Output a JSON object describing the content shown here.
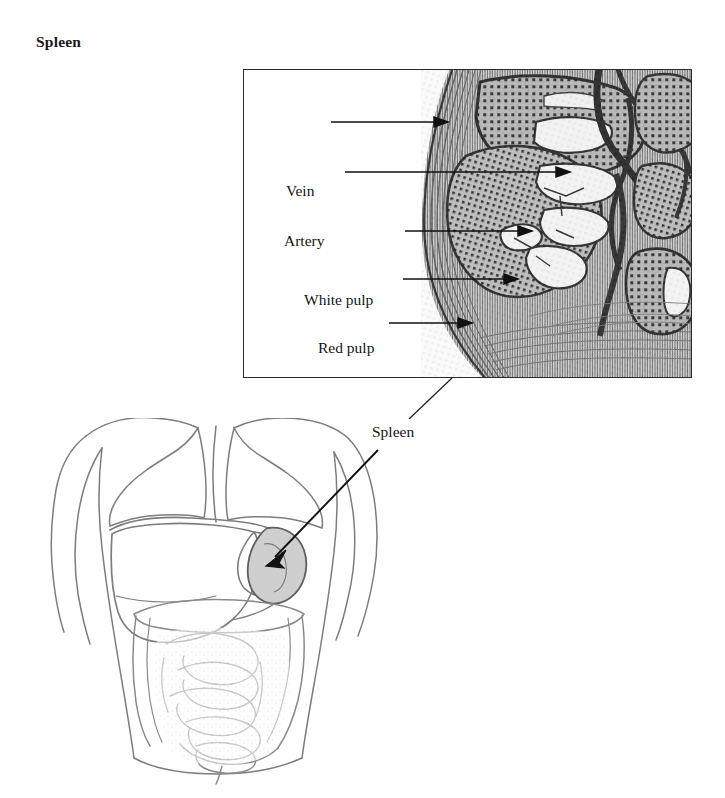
{
  "figure": {
    "title": "Spleen"
  },
  "inset": {
    "name": "spleen-histology-micrograph",
    "labels": [
      {
        "id": "vein",
        "text": "Vein",
        "text_x": 285,
        "text_y": 111,
        "line_x1": 330,
        "line_y1": 121,
        "line_x2": 452,
        "line_y2": 121
      },
      {
        "id": "artery",
        "text": "Artery",
        "text_x": 283,
        "text_y": 159,
        "line_x1": 344,
        "line_y1": 171,
        "line_x2": 572,
        "line_y2": 171
      },
      {
        "id": "white-pulp",
        "text": "White pulp",
        "text_x": 303,
        "text_y": 220,
        "line_x1": 404,
        "line_y1": 230,
        "line_x2": 532,
        "line_y2": 230
      },
      {
        "id": "red-pulp",
        "text": "Red pulp",
        "text_x": 317,
        "text_y": 267,
        "line_x1": 402,
        "line_y1": 278,
        "line_x2": 518,
        "line_y2": 278
      },
      {
        "id": "capsule",
        "text": "Capsule",
        "text_x": 310,
        "text_y": 311,
        "line_x1": 388,
        "line_y1": 322,
        "line_x2": 472,
        "line_y2": 322
      }
    ]
  },
  "body": {
    "name": "human-torso-anatomy",
    "callout": {
      "label": "Spleen",
      "leader_from_x": 452,
      "leader_from_y": 378,
      "leader_to_x": 409,
      "leader_to_y": 419,
      "arrow_from_x": 378,
      "arrow_from_y": 450,
      "arrow_to_x": 266,
      "arrow_to_y": 566
    },
    "organs": [
      {
        "id": "lung-left",
        "label": "lung"
      },
      {
        "id": "lung-right",
        "label": "lung"
      },
      {
        "id": "liver",
        "label": "liver"
      },
      {
        "id": "spleen",
        "label": "spleen"
      },
      {
        "id": "stomach",
        "label": "stomach"
      },
      {
        "id": "transverse-colon",
        "label": "transverse colon"
      },
      {
        "id": "small-intestine",
        "label": "small intestine"
      },
      {
        "id": "ascending-colon",
        "label": "ascending colon"
      },
      {
        "id": "descending-colon",
        "label": "descending colon"
      }
    ]
  },
  "colors": {
    "ink": "#1a1a1a",
    "line": "#151515",
    "panel_border": "#2a2a2a",
    "tissue_dark": "#3a3a3a",
    "tissue_mid": "#8a8a8a",
    "tissue_light": "#d8d8d8",
    "lumen_white": "#f8f8f8",
    "organ_outline": "#6e6e6e",
    "spleen_fill": "#cfcfcf",
    "background": "#ffffff"
  }
}
